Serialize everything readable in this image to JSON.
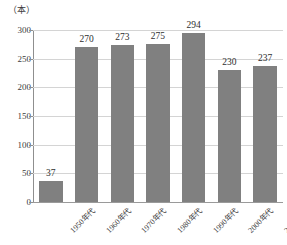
{
  "chart_data": {
    "type": "bar",
    "title": "",
    "subtitle": "",
    "unit_label": "（本）",
    "xlabel": "",
    "ylabel": "",
    "categories": [
      "1950年代",
      "1960年代",
      "1970年代",
      "1980年代",
      "1990年代",
      "2000年代",
      "2010年代"
    ],
    "values": [
      37,
      270,
      273,
      275,
      294,
      230,
      237
    ],
    "series": [
      {
        "name": "本数",
        "values": [
          37,
          270,
          273,
          275,
          294,
          230,
          237
        ]
      }
    ],
    "ylim": [
      0,
      300
    ],
    "yticks": [
      0,
      50,
      100,
      150,
      200,
      250,
      300
    ],
    "ytick_labels": [
      "0",
      "50",
      "100",
      "150",
      "200",
      "250",
      "300"
    ],
    "grid": true,
    "grid_axis": "y",
    "legend": false,
    "legend_position": "none",
    "bar_color": "#808080",
    "grid_color": "#d4d4d4",
    "axis_color": "#8f8f8f",
    "data_labels": [
      "37",
      "270",
      "273",
      "275",
      "294",
      "230",
      "237"
    ],
    "xtick_rotation": -45
  }
}
